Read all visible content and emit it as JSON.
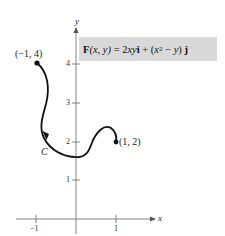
{
  "figure": {
    "formula": {
      "lhs_bold": "F",
      "lhs_args": "(x, y)",
      "equals": " = 2",
      "term1_var": "xy",
      "term1_unit": "i",
      "plus": " + (",
      "x2_var": "x",
      "x2_exp": "2",
      "minus": " − ",
      "y_var": "y",
      "close": ") ",
      "term2_unit": "j"
    },
    "axes": {
      "x_label": "x",
      "y_label": "y",
      "x_ticks": [
        "−1",
        "1"
      ],
      "y_ticks": [
        "1",
        "2",
        "3",
        "4"
      ]
    },
    "points": {
      "start_label": "(−1, 4)",
      "end_label": "(1, 2)"
    },
    "curve_label": "C",
    "colors": {
      "formula_bg": "#d9d9d9",
      "axis": "#777777",
      "curve": "#111111"
    }
  }
}
